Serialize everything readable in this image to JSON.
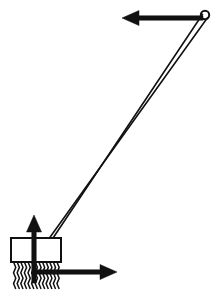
{
  "figure": {
    "title": "Broom with applied force vectors",
    "width": 223,
    "height": 295,
    "background_color": "#ffffff",
    "stroke_color": "#111111",
    "fill_color": "#ffffff"
  },
  "parts": {
    "handle": {
      "name": "broom-handle",
      "type": "double-rod",
      "rod_count": 2,
      "top_point": [
        205,
        16
      ],
      "bottom_point": [
        52,
        239
      ],
      "stroke_width": 1.6,
      "rod_offset": 6
    },
    "handle_loop": {
      "name": "handle-loop",
      "type": "circle",
      "center": [
        205,
        15
      ],
      "radius": 4.2,
      "stroke_width": 2.0
    },
    "brush_body": {
      "name": "brush-body",
      "type": "rectangle",
      "x": 11,
      "y": 238,
      "width": 50,
      "height": 24,
      "stroke_width": 2.0
    },
    "bristles": {
      "name": "brush-bristles",
      "type": "zigzag-lines",
      "left": 13,
      "right": 60,
      "top": 262,
      "bottom": 289,
      "count": 13,
      "stroke_width": 1.5
    }
  },
  "vectors": [
    {
      "id": "force-left",
      "name": "arrow-left-at-handle",
      "direction": "left",
      "tail": [
        203,
        18
      ],
      "head": [
        122,
        18
      ],
      "shaft_width": 4.5,
      "head_length": 17,
      "head_width": 15,
      "color": "#111111"
    },
    {
      "id": "force-up",
      "name": "arrow-up-at-brush",
      "direction": "up",
      "tail": [
        34,
        283
      ],
      "head": [
        34,
        215
      ],
      "shaft_width": 4.5,
      "head_length": 17,
      "head_width": 15,
      "color": "#111111"
    },
    {
      "id": "force-right",
      "name": "arrow-right-at-brush",
      "direction": "right",
      "tail": [
        34,
        272
      ],
      "head": [
        117,
        272
      ],
      "shaft_width": 4.5,
      "head_length": 17,
      "head_width": 15,
      "color": "#111111"
    }
  ],
  "labels": {
    "caption": "",
    "annotations": []
  }
}
